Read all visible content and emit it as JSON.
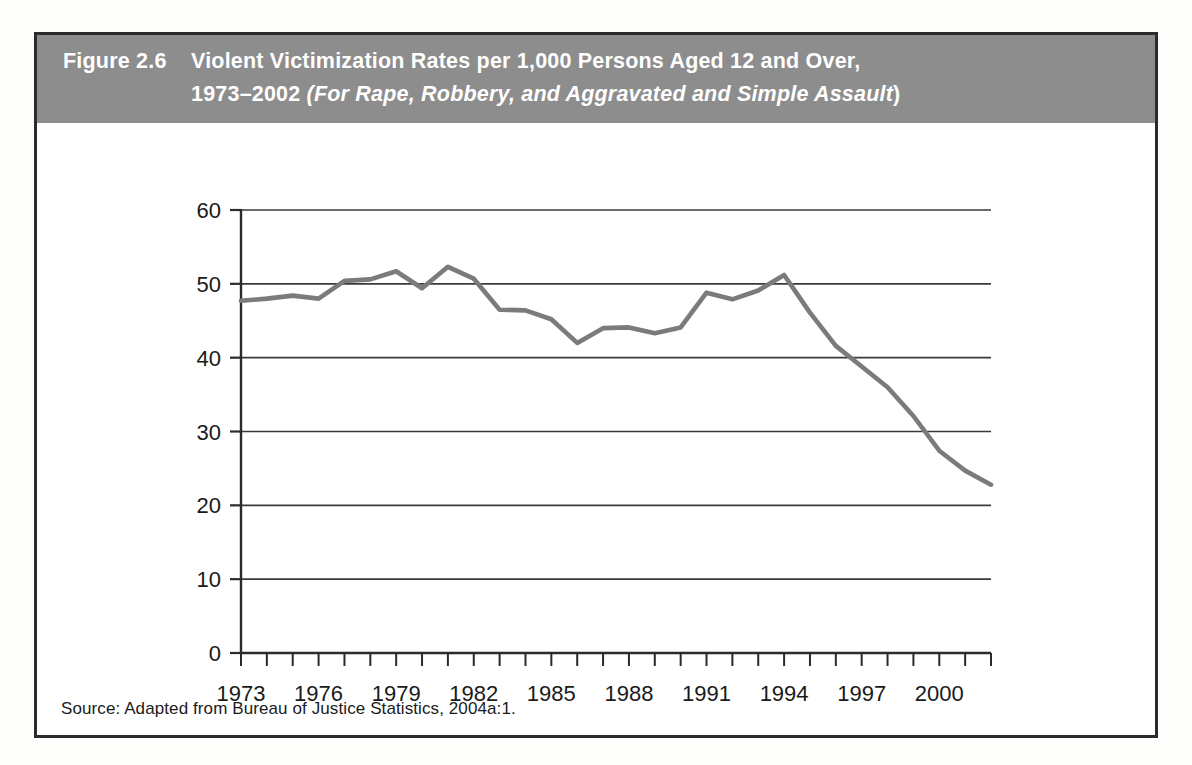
{
  "figure": {
    "label": "Figure 2.6",
    "title_line1": "Violent Victimization Rates per 1,000 Persons Aged 12 and Over,",
    "title_line2_plain": "1973–2002 ",
    "title_line2_italic": "(For Rape, Robbery, and Aggravated and Simple Assault",
    "title_line2_tail": ")",
    "source": "Source: Adapted from Bureau of Justice Statistics, 2004a:1.",
    "header_bg": "#8d8d8d",
    "header_fg": "#ffffff",
    "border_color": "#2b2b2b",
    "line_color": "#7b7b7b",
    "grid_color": "#3a3a3a"
  },
  "chart_data": {
    "type": "line",
    "title": "Violent Victimization Rates per 1,000 Persons Aged 12 and Over, 1973–2002",
    "subtitle": "(For Rape, Robbery, and Aggravated and Simple Assault)",
    "xlabel": "",
    "ylabel": "",
    "xlim": [
      1973,
      2002
    ],
    "ylim": [
      0,
      60
    ],
    "ytick_labels": [
      "0",
      "10",
      "20",
      "30",
      "40",
      "50",
      "60"
    ],
    "yticks": [
      0,
      10,
      20,
      30,
      40,
      50,
      60
    ],
    "xtick_labels": [
      "1973",
      "1976",
      "1979",
      "1982",
      "1985",
      "1988",
      "1991",
      "1994",
      "1997",
      "2000"
    ],
    "xticks": [
      1973,
      1976,
      1979,
      1982,
      1985,
      1988,
      1991,
      1994,
      1997,
      2000
    ],
    "minor_xticks_every": 1,
    "grid": "horizontal",
    "legend": "none",
    "x": [
      1973,
      1974,
      1975,
      1976,
      1977,
      1978,
      1979,
      1980,
      1981,
      1982,
      1983,
      1984,
      1985,
      1986,
      1987,
      1988,
      1989,
      1990,
      1991,
      1992,
      1993,
      1994,
      1995,
      1996,
      1997,
      1998,
      1999,
      2000,
      2001,
      2002
    ],
    "series": [
      {
        "name": "Violent victimization rate",
        "values": [
          47.7,
          48.0,
          48.4,
          48.0,
          50.4,
          50.6,
          51.7,
          49.4,
          52.3,
          50.7,
          46.5,
          46.4,
          45.2,
          42.0,
          44.0,
          44.1,
          43.3,
          44.1,
          48.8,
          47.9,
          49.1,
          51.2,
          46.1,
          41.6,
          38.8,
          36.0,
          32.1,
          27.4,
          24.7,
          22.8
        ]
      }
    ]
  }
}
